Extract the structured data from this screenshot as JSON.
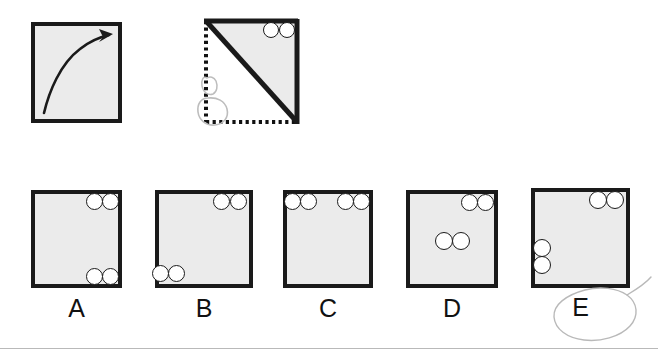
{
  "item": {
    "type": "paper-folding-spatial-reasoning",
    "prompt_row": {
      "fold_square": {
        "annotation": "curved-fold-arrow",
        "arrow_from": "bottom-left",
        "arrow_to": "top-right"
      },
      "folded_square": {
        "fold_line": "diagonal top-left to bottom-right",
        "solid_edges": [
          "top",
          "right"
        ],
        "dotted_edges": [
          "left",
          "bottom"
        ],
        "shaded_region": "upper-right triangle",
        "holes": [
          {
            "position": "top-right",
            "index": 1
          },
          {
            "position": "top-right",
            "index": 2
          }
        ],
        "handdrawn_marks": [
          "pencil-loop-small",
          "pencil-loop-large"
        ]
      }
    },
    "options": [
      {
        "id": "A",
        "label": "A",
        "holes": [
          {
            "corner": "top-right",
            "index": 1
          },
          {
            "corner": "top-right",
            "index": 2
          },
          {
            "corner": "bottom-right",
            "index": 1
          },
          {
            "corner": "bottom-right",
            "index": 2
          }
        ],
        "selected": false
      },
      {
        "id": "B",
        "label": "B",
        "holes": [
          {
            "corner": "top-right",
            "index": 1
          },
          {
            "corner": "top-right",
            "index": 2
          },
          {
            "corner": "bottom-left",
            "index": 1
          },
          {
            "corner": "bottom-left",
            "index": 2
          }
        ],
        "selected": false
      },
      {
        "id": "C",
        "label": "C",
        "holes": [
          {
            "corner": "top-left",
            "index": 1
          },
          {
            "corner": "top-left",
            "index": 2
          },
          {
            "corner": "top-right",
            "index": 1
          },
          {
            "corner": "top-right",
            "index": 2
          }
        ],
        "selected": false
      },
      {
        "id": "D",
        "label": "D",
        "holes": [
          {
            "corner": "top-right",
            "index": 1
          },
          {
            "corner": "top-right",
            "index": 2
          },
          {
            "corner": "center-left",
            "index": 1
          },
          {
            "corner": "center-left",
            "index": 2
          }
        ],
        "selected": false
      },
      {
        "id": "E",
        "label": "E",
        "holes": [
          {
            "corner": "top-right",
            "index": 1
          },
          {
            "corner": "top-right",
            "index": 2
          },
          {
            "corner": "left-lower",
            "index": 1
          },
          {
            "corner": "left-lower",
            "index": 2
          }
        ],
        "selected": true,
        "selection_mark": "handdrawn-ellipse"
      }
    ]
  },
  "colors": {
    "paper_fill": "#ebebeb",
    "outline": "#1a1a1a",
    "hole_fill": "#ffffff",
    "pencil": "#b9b9b9",
    "rule": "#b9b9b9",
    "background": "#ffffff"
  }
}
